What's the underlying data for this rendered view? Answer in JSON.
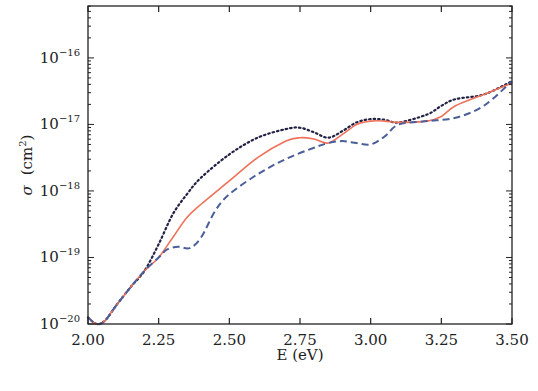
{
  "chart_data": {
    "type": "line",
    "title": "",
    "xlabel": "E (eV)",
    "ylabel": "σ (cm²)",
    "ylabel_parts": {
      "symbol": "σ",
      "unit": "(cm",
      "exp": "2",
      "close": ")"
    },
    "xlim": [
      2.0,
      3.5
    ],
    "ylim_log10": [
      -20,
      -15.22
    ],
    "yscale": "log",
    "grid": false,
    "legend": null,
    "x_ticks": [
      "2.00",
      "2.25",
      "2.50",
      "2.75",
      "3.00",
      "3.25",
      "3.50"
    ],
    "x_tick_values": [
      2.0,
      2.25,
      2.5,
      2.75,
      3.0,
      3.25,
      3.5
    ],
    "y_ticks": [
      {
        "base": "10",
        "exp": "−20",
        "value": -20
      },
      {
        "base": "10",
        "exp": "−19",
        "value": -19
      },
      {
        "base": "10",
        "exp": "−18",
        "value": -18
      },
      {
        "base": "10",
        "exp": "−17",
        "value": -17
      },
      {
        "base": "10",
        "exp": "−16",
        "value": -16
      }
    ],
    "series": [
      {
        "name": "dotted",
        "style": "dotted",
        "color": "#222244",
        "x": [
          2.0,
          2.03,
          2.06,
          2.1,
          2.15,
          2.2,
          2.25,
          2.3,
          2.35,
          2.4,
          2.5,
          2.6,
          2.7,
          2.75,
          2.8,
          2.85,
          2.9,
          2.95,
          3.0,
          3.05,
          3.1,
          3.2,
          3.25,
          3.3,
          3.4,
          3.5
        ],
        "log10_y": [
          -19.9,
          -20.0,
          -19.95,
          -19.72,
          -19.45,
          -19.2,
          -18.8,
          -18.35,
          -18.05,
          -17.8,
          -17.45,
          -17.2,
          -17.07,
          -17.05,
          -17.12,
          -17.2,
          -17.1,
          -16.97,
          -16.92,
          -16.93,
          -16.97,
          -16.85,
          -16.72,
          -16.62,
          -16.55,
          -16.35
        ]
      },
      {
        "name": "solid",
        "style": "solid",
        "color": "#f0715a",
        "x": [
          2.0,
          2.03,
          2.06,
          2.1,
          2.15,
          2.2,
          2.25,
          2.3,
          2.35,
          2.4,
          2.5,
          2.6,
          2.7,
          2.75,
          2.8,
          2.85,
          2.9,
          2.95,
          3.0,
          3.05,
          3.1,
          3.2,
          3.25,
          3.3,
          3.4,
          3.5
        ],
        "log10_y": [
          -19.9,
          -20.0,
          -19.95,
          -19.72,
          -19.45,
          -19.2,
          -19.0,
          -18.7,
          -18.4,
          -18.2,
          -17.85,
          -17.5,
          -17.25,
          -17.2,
          -17.22,
          -17.28,
          -17.15,
          -17.0,
          -16.95,
          -16.95,
          -16.97,
          -16.95,
          -16.88,
          -16.72,
          -16.55,
          -16.38
        ]
      },
      {
        "name": "dashed",
        "style": "dashed",
        "color": "#4a5f9a",
        "x": [
          2.0,
          2.03,
          2.06,
          2.1,
          2.15,
          2.2,
          2.25,
          2.28,
          2.32,
          2.36,
          2.4,
          2.45,
          2.5,
          2.6,
          2.7,
          2.8,
          2.85,
          2.9,
          2.95,
          3.0,
          3.05,
          3.1,
          3.2,
          3.3,
          3.4,
          3.5
        ],
        "log10_y": [
          -19.9,
          -20.0,
          -19.95,
          -19.72,
          -19.45,
          -19.2,
          -19.0,
          -18.88,
          -18.84,
          -18.86,
          -18.7,
          -18.3,
          -18.05,
          -17.75,
          -17.52,
          -17.35,
          -17.28,
          -17.25,
          -17.28,
          -17.3,
          -17.18,
          -17.0,
          -16.95,
          -16.9,
          -16.72,
          -16.35
        ]
      }
    ]
  }
}
